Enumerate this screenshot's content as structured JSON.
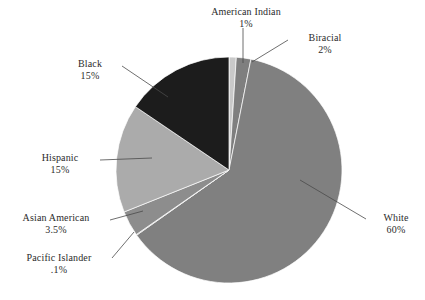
{
  "chart_data": {
    "type": "pie",
    "title": "",
    "subtitle": "",
    "xlabel": "",
    "ylabel": "",
    "legend_position": "none",
    "grid": false,
    "label_style": "outside-with-leader-lines",
    "categories": [
      "American Indian",
      "Biracial",
      "White",
      "Pacific Islander",
      "Asian American",
      "Hispanic",
      "Black"
    ],
    "values": [
      1,
      2,
      60,
      0.1,
      3.5,
      15,
      15
    ],
    "value_labels": [
      "1%",
      "2%",
      "60%",
      ".1%",
      "3.5%",
      "15%",
      "15%"
    ],
    "colors": [
      "#c9c9c9",
      "#7f7f7f",
      "#808080",
      "#9a9a9a",
      "#8d8d8d",
      "#ababab",
      "#1c1c1c"
    ],
    "slices": [
      {
        "name": "American Indian",
        "value": 1,
        "value_label": "1%",
        "color": "#c9c9c9"
      },
      {
        "name": "Biracial",
        "value": 2,
        "value_label": "2%",
        "color": "#7f7f7f"
      },
      {
        "name": "White",
        "value": 60,
        "value_label": "60%",
        "color": "#808080"
      },
      {
        "name": "Pacific Islander",
        "value": 0.1,
        "value_label": ".1%",
        "color": "#9a9a9a"
      },
      {
        "name": "Asian American",
        "value": 3.5,
        "value_label": "3.5%",
        "color": "#8d8d8d"
      },
      {
        "name": "Hispanic",
        "value": 15,
        "value_label": "15%",
        "color": "#ababab"
      },
      {
        "name": "Black",
        "value": 15,
        "value_label": "15%",
        "color": "#1c1c1c"
      }
    ]
  },
  "labels": {
    "american_indian": {
      "name": "American Indian",
      "value": "1%"
    },
    "biracial": {
      "name": "Biracial",
      "value": "2%"
    },
    "black": {
      "name": "Black",
      "value": "15%"
    },
    "hispanic": {
      "name": "Hispanic",
      "value": "15%"
    },
    "asian_american": {
      "name": "Asian American",
      "value": "3.5%"
    },
    "pacific_islander": {
      "name": "Pacific Islander",
      "value": ".1%"
    },
    "white": {
      "name": "White",
      "value": "60%"
    }
  }
}
